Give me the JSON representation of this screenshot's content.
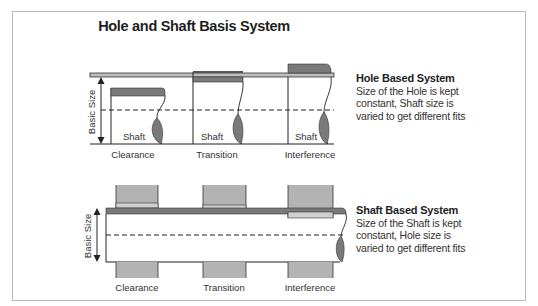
{
  "title": "Hole and Shaft Basis System",
  "colors": {
    "frame": "#b9b9b9",
    "tolerance_zone_dark": "#7a7a7a",
    "tolerance_zone_light": "#bdbdbd",
    "hole_block": "#b3b3b3",
    "line": "#222222"
  },
  "hole_based": {
    "heading": "Hole Based System",
    "description_lines": [
      "Size of the Hole is kept",
      "constant, Shaft size is",
      "varied to get different fits"
    ],
    "dimension_label": "Basic Size",
    "shaft_label": "Shaft",
    "fits": [
      "Clearance",
      "Transition",
      "Interference"
    ]
  },
  "shaft_based": {
    "heading": "Shaft Based System",
    "description_lines": [
      "Size of the Shaft is kept",
      "constant, Hole size is",
      "varied to get different fits"
    ],
    "dimension_label": "Basic Size",
    "fits": [
      "Clearance",
      "Transition",
      "Interference"
    ]
  }
}
